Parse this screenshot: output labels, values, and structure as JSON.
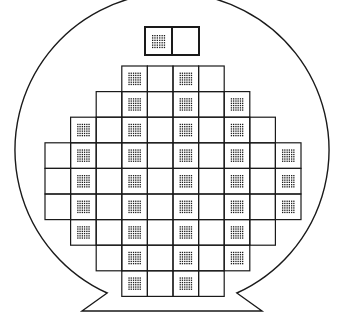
{
  "diagram": {
    "title": "",
    "type": "semiconductor wafer map",
    "colors": {
      "line": "#1a1a1a",
      "background": "#ffffff",
      "dot": "#1a1a1a"
    },
    "wafer": {
      "cx": 172,
      "cy": 168,
      "r": 157,
      "flat_y": 311,
      "flat_x1": 82,
      "flat_x2": 262
    },
    "grid": {
      "x0": 45,
      "y0": 66,
      "cell": 25.6,
      "dot_grid": "6x6"
    },
    "rows": [
      {
        "row": 0,
        "cols": [
          3,
          6
        ],
        "patterned": [
          3,
          5
        ]
      },
      {
        "row": 1,
        "cols": [
          2,
          7
        ],
        "patterned": [
          3,
          5,
          7
        ]
      },
      {
        "row": 2,
        "cols": [
          1,
          8
        ],
        "patterned": [
          1,
          3,
          5,
          7
        ]
      },
      {
        "row": 3,
        "cols": [
          0,
          9
        ],
        "patterned": [
          1,
          3,
          5,
          7,
          9
        ]
      },
      {
        "row": 4,
        "cols": [
          0,
          9
        ],
        "patterned": [
          1,
          3,
          5,
          7,
          9
        ]
      },
      {
        "row": 5,
        "cols": [
          0,
          9
        ],
        "patterned": [
          1,
          3,
          5,
          7,
          9
        ]
      },
      {
        "row": 6,
        "cols": [
          1,
          8
        ],
        "patterned": [
          1,
          3,
          5,
          7
        ]
      },
      {
        "row": 7,
        "cols": [
          2,
          7
        ],
        "patterned": [
          3,
          5,
          7
        ]
      },
      {
        "row": 8,
        "cols": [
          3,
          6
        ],
        "patterned": [
          3,
          5
        ]
      }
    ],
    "test_key": {
      "x": 145,
      "y": 27,
      "w": 54,
      "h": 28,
      "cells": [
        {
          "patterned": true
        },
        {
          "patterned": false
        }
      ]
    }
  }
}
